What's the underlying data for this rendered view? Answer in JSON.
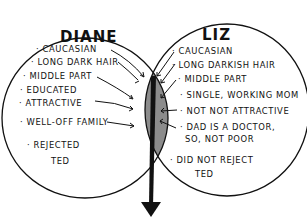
{
  "diagram": {
    "type": "venn",
    "colors": {
      "overlap_fill": "#8c8c8c",
      "stroke": "#111111",
      "background": "#ffffff"
    },
    "left": {
      "title": "DIANE",
      "items": [
        "· CAUCASIAN",
        "· LONG DARK HAIR",
        "· MIDDLE PART",
        "· EDUCATED",
        "· ATTRACTIVE",
        "· WELL-OFF FAMILY",
        "· REJECTED",
        "TED"
      ]
    },
    "right": {
      "title": "LIZ",
      "items": [
        "· CAUCASIAN",
        "· LONG DARKISH HAIR",
        "· MIDDLE PART",
        "· SINGLE, WORKING MOM",
        "· NOT NOT ATTRACTIVE",
        "· DAD IS A DOCTOR,",
        "SO, NOT POOR",
        "· DID NOT REJECT",
        "TED"
      ]
    }
  }
}
